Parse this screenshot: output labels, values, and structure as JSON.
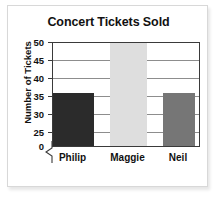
{
  "chart_data": {
    "type": "bar",
    "title": "Concert Tickets Sold",
    "xlabel": "",
    "ylabel": "Number of Tickets",
    "categories": [
      "Philip",
      "Maggie",
      "Neil"
    ],
    "values": [
      35,
      50,
      35
    ],
    "bar_colors": [
      "#2b2b2b",
      "#dedede",
      "#767676"
    ],
    "ylim": [
      25,
      50
    ],
    "y_ticks": [
      50,
      45,
      40,
      35,
      30,
      25,
      0
    ],
    "axis_break": true,
    "axis_break_note": "zigzag break between 0 and 25",
    "grid": true,
    "legend": "none",
    "annotations": [
      "Maggie's bar extends to the top of the plot area (50 or more)."
    ]
  },
  "figure": {
    "title": "Concert Tickets Sold",
    "y_axis_title": "Number of Tickets",
    "y_ticks": [
      {
        "label": "50"
      },
      {
        "label": "45"
      },
      {
        "label": "40"
      },
      {
        "label": "35"
      },
      {
        "label": "30"
      },
      {
        "label": "25"
      },
      {
        "label": "0"
      }
    ],
    "x_ticks": [
      {
        "label": "Philip"
      },
      {
        "label": "Maggie"
      },
      {
        "label": "Neil"
      }
    ],
    "bars": [
      {
        "name": "Philip",
        "value": 35,
        "color": "#2b2b2b"
      },
      {
        "name": "Maggie",
        "value": 50,
        "color": "#dedede"
      },
      {
        "name": "Neil",
        "value": 35,
        "color": "#767676"
      }
    ],
    "colors": {
      "axis": "#3a3a3a",
      "gridline": "#8d8d8d",
      "card_border": "#d8d8d8",
      "text": "#111111",
      "background": "#ffffff"
    }
  }
}
